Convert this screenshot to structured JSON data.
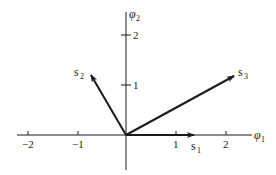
{
  "diagram": {
    "type": "vector-signal-space",
    "axes": {
      "x": {
        "label": "φ",
        "subscript": "1",
        "ticks": [
          {
            "value": -2,
            "label": "−2"
          },
          {
            "value": -1,
            "label": "−1"
          },
          {
            "value": 1,
            "label": "1"
          },
          {
            "value": 2,
            "label": "2"
          }
        ]
      },
      "y": {
        "label": "φ",
        "subscript": "2",
        "ticks": [
          {
            "value": 1,
            "label": "1"
          },
          {
            "value": 2,
            "label": "2"
          }
        ]
      }
    },
    "vectors": [
      {
        "name": "s",
        "subscript": "1",
        "x": 1.35,
        "y": 0
      },
      {
        "name": "s",
        "subscript": "2",
        "x": -0.7,
        "y": 1.2
      },
      {
        "name": "s",
        "subscript": "3",
        "x": 2.15,
        "y": 1.2
      }
    ],
    "colors": {
      "ink": "#1a1a1a",
      "background": "#ffffff"
    }
  }
}
